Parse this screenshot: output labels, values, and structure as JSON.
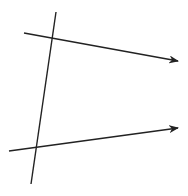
{
  "diagram": {
    "stroke_color": "#222222",
    "background": "#ffffff",
    "transversal": {
      "x1": 56,
      "y1": 12,
      "x2": 31,
      "y2": 184
    },
    "upper_ray": {
      "x1": 24,
      "y1": 33,
      "x2": 178,
      "y2": 61,
      "arrow": true
    },
    "lower_ray": {
      "x1": 9,
      "y1": 151,
      "x2": 178,
      "y2": 128,
      "arrow": true
    }
  }
}
